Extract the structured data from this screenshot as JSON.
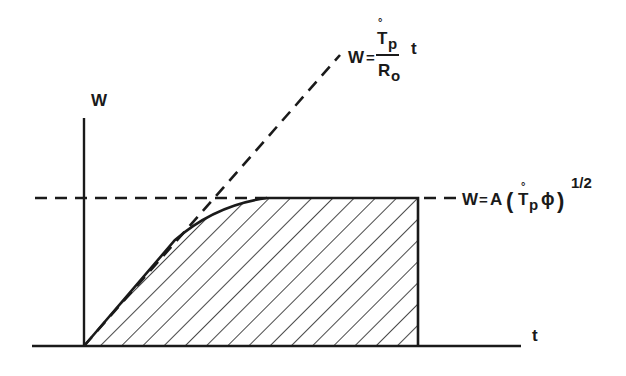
{
  "diagram": {
    "type": "graph-sketch",
    "axes": {
      "y_label": "W",
      "x_label": "t"
    },
    "lines": [
      {
        "name": "linear-asymptote",
        "style": "dashed",
        "equation": {
          "lhs": "W",
          "numerator_symbol": "T",
          "numerator_subscript": "p",
          "numerator_accent": "°",
          "denominator_symbol": "R",
          "denominator_subscript": "o",
          "trailing": "t"
        }
      },
      {
        "name": "plateau-asymptote",
        "style": "dashed",
        "equation": {
          "lhs": "W",
          "coef": "A",
          "open_bracket": "(",
          "symbol": "T",
          "subscript": "p",
          "accent": "°",
          "phi": "ϕ",
          "close_bracket": ")",
          "exponent": "1/2"
        }
      },
      {
        "name": "response-curve",
        "style": "solid",
        "region": "hatched"
      }
    ],
    "colors": {
      "ink": "#1a1a1a",
      "background": "#ffffff"
    }
  }
}
